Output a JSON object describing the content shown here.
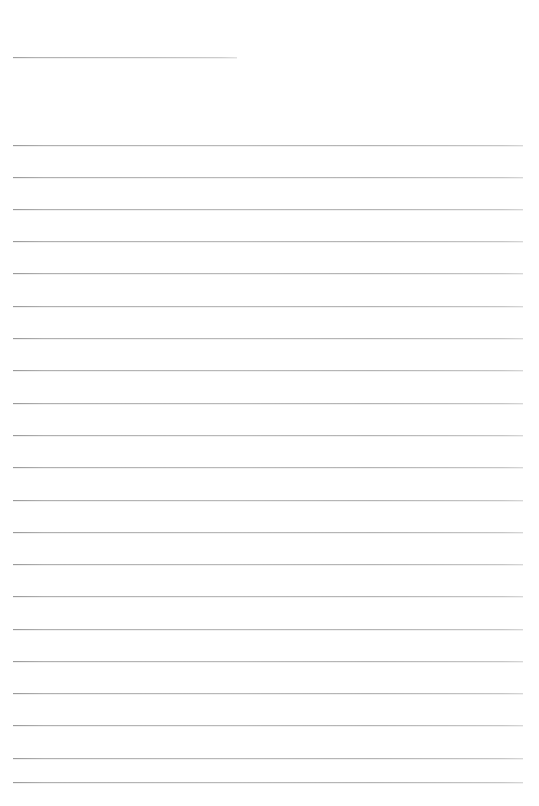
{
  "document": {
    "type": "ruled-writing-sheet",
    "title": "",
    "body_text": "",
    "page_width": 539,
    "page_height": 806,
    "background_color": "#ffffff",
    "rule_color": "#b5b5b5",
    "rule_thickness_px": 1
  },
  "heading_rule": {
    "name": "heading-rule",
    "label": "",
    "x_start": 13,
    "x_end": 237,
    "y": 57,
    "width": 224,
    "filled_text": ""
  },
  "body_rules": {
    "name": "body-rules",
    "count": 20,
    "x_start": 13,
    "x_end": 523,
    "width": 510,
    "first_y": 145,
    "spacing": 32.4,
    "last_y": 782,
    "lines": [
      {
        "index": 1,
        "y": 145,
        "text": ""
      },
      {
        "index": 2,
        "y": 177,
        "text": ""
      },
      {
        "index": 3,
        "y": 209,
        "text": ""
      },
      {
        "index": 4,
        "y": 241,
        "text": ""
      },
      {
        "index": 5,
        "y": 273,
        "text": ""
      },
      {
        "index": 6,
        "y": 306,
        "text": ""
      },
      {
        "index": 7,
        "y": 338,
        "text": ""
      },
      {
        "index": 8,
        "y": 370,
        "text": ""
      },
      {
        "index": 9,
        "y": 403,
        "text": ""
      },
      {
        "index": 10,
        "y": 435,
        "text": ""
      },
      {
        "index": 11,
        "y": 467,
        "text": ""
      },
      {
        "index": 12,
        "y": 500,
        "text": ""
      },
      {
        "index": 13,
        "y": 532,
        "text": ""
      },
      {
        "index": 14,
        "y": 564,
        "text": ""
      },
      {
        "index": 15,
        "y": 596,
        "text": ""
      },
      {
        "index": 16,
        "y": 629,
        "text": ""
      },
      {
        "index": 17,
        "y": 661,
        "text": ""
      },
      {
        "index": 18,
        "y": 693,
        "text": ""
      },
      {
        "index": 19,
        "y": 725,
        "text": ""
      },
      {
        "index": 20,
        "y": 758,
        "text": ""
      },
      {
        "index": 21,
        "y": 782,
        "text": ""
      }
    ]
  }
}
